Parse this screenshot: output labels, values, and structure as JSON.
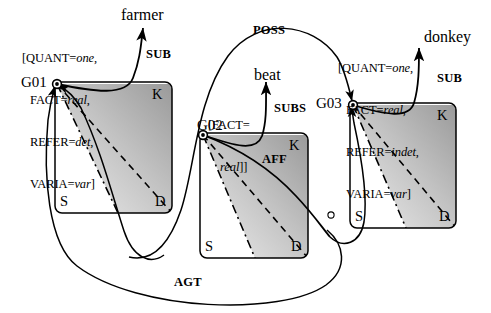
{
  "figure": {
    "type": "conceptual-graph-diagram",
    "background_color": "#ffffff",
    "ink_color": "#000000",
    "box_fill_dark": "#9c9c9c",
    "box_fill_light": "#e8e8e8"
  },
  "nodes": [
    {
      "id": "G01",
      "label": "G01",
      "attributes": [
        {
          "key": "[QUANT=",
          "value": "one",
          "tail": ","
        },
        {
          "key": "FACT=",
          "value": "real",
          "tail": ","
        },
        {
          "key": "REFER=",
          "value": "det",
          "tail": ","
        },
        {
          "key": "VARIA=",
          "value": "var",
          "tail": "]"
        }
      ],
      "corners": {
        "k": "K",
        "s": "S",
        "d": "D"
      }
    },
    {
      "id": "G02",
      "label": "G02",
      "attributes": [
        {
          "key": "[FACT=",
          "value": "",
          "tail": ""
        },
        {
          "key": "",
          "value": "real",
          "tail": "]]"
        }
      ],
      "corners": {
        "k": "K",
        "s": "S",
        "d": "D"
      }
    },
    {
      "id": "G03",
      "label": "G03",
      "attributes": [
        {
          "key": "[QUANT=",
          "value": "one",
          "tail": ","
        },
        {
          "key": "FACT=",
          "value": "real",
          "tail": ","
        },
        {
          "key": "REFER=",
          "value": "indet",
          "tail": ","
        },
        {
          "key": "VARIA=",
          "value": "var",
          "tail": "]"
        }
      ],
      "corners": {
        "k": "K",
        "s": "S",
        "d": "D"
      }
    }
  ],
  "words": [
    {
      "id": "farmer",
      "text": "farmer"
    },
    {
      "id": "beat",
      "text": "beat"
    },
    {
      "id": "donkey",
      "text": "donkey"
    }
  ],
  "relations": [
    {
      "id": "sub-farmer",
      "label": "SUB"
    },
    {
      "id": "subs-beat",
      "label": "SUBS"
    },
    {
      "id": "sub-donkey",
      "label": "SUB"
    },
    {
      "id": "poss",
      "label": "POSS"
    },
    {
      "id": "aff",
      "label": "AFF"
    },
    {
      "id": "agt",
      "label": "AGT"
    }
  ],
  "corner_labels": {
    "g01_k": "K",
    "g01_s": "S",
    "g01_d": "D",
    "g02_k": "K",
    "g02_s": "S",
    "g02_d": "D",
    "g03_k": "K",
    "g03_s": "S",
    "g03_d": "D"
  }
}
